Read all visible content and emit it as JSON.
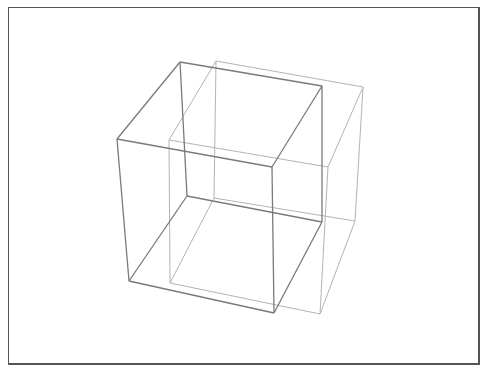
{
  "diagram": {
    "title": "",
    "colors": {
      "frame": "#555555",
      "front_cube": "#7a7a7a",
      "back_cube": "#b4b4b4",
      "background": "#ffffff"
    },
    "cubes": [
      {
        "name": "front-cube",
        "stroke": "#7a7a7a",
        "width": 1.3,
        "vertices": {
          "tl_back": [
            180,
            62
          ],
          "tr_back": [
            322,
            86
          ],
          "bl_back": [
            187,
            196
          ],
          "br_back": [
            322,
            222
          ],
          "tl_front": [
            117,
            139
          ],
          "tr_front": [
            272,
            167
          ],
          "bl_front": [
            129,
            281
          ],
          "br_front": [
            274,
            313
          ]
        }
      },
      {
        "name": "back-cube",
        "stroke": "#b4b4b4",
        "width": 1,
        "vertices": {
          "tl_back": [
            216,
            61
          ],
          "tr_back": [
            363,
            87
          ],
          "bl_back": [
            214,
            198
          ],
          "br_back": [
            355,
            221
          ],
          "tl_front": [
            169,
            140
          ],
          "tr_front": [
            328,
            167
          ],
          "bl_front": [
            170,
            283
          ],
          "br_front": [
            320,
            314
          ]
        }
      }
    ]
  }
}
